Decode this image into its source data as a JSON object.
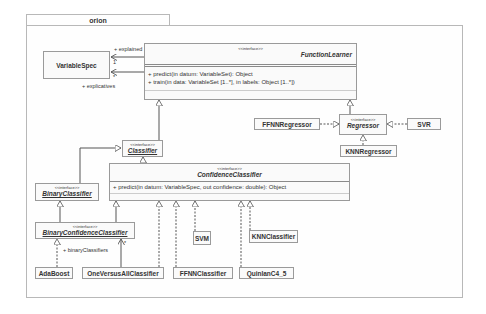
{
  "package": {
    "name": "orion"
  },
  "classes": {
    "variable_spec": {
      "name": "VariableSpec"
    },
    "function_learner": {
      "stereotype": "<<interface>>",
      "name": "FunctionLearner",
      "methods": [
        "+ predict(in datum: VariableSet): Object",
        "+ train(in data: VariableSet [1..*], in labels: Object [1..*])"
      ]
    },
    "regressor": {
      "stereotype": "<<interface>>",
      "name": "Regressor"
    },
    "ffnn_regressor": {
      "name": "FFNNRegressor"
    },
    "svr": {
      "name": "SVR"
    },
    "knn_regressor": {
      "name": "KNNRegressor"
    },
    "classifier": {
      "stereotype": "<<interface>>",
      "name": "Classifier"
    },
    "confidence_classifier": {
      "stereotype": "<<interface>>",
      "name": "ConfidenceClassifier",
      "methods": [
        "+ predict(in datum: VariableSpec, out confidence: double): Object"
      ]
    },
    "binary_classifier": {
      "stereotype": "<<interface>>",
      "name": "BinaryClassifier"
    },
    "binary_confidence_classifier": {
      "stereotype": "<<interface>>",
      "name": "BinaryConfidenceClassifier"
    },
    "ada_boost": {
      "name": "AdaBoost"
    },
    "one_versus_all": {
      "name": "OneVersusAllClassifier"
    },
    "svm": {
      "name": "SVM"
    },
    "knn_classifier": {
      "name": "KNNClassifier"
    },
    "ffnn_classifier": {
      "name": "FFNNClassifier"
    },
    "quinlan": {
      "name": "QuinlanC4_5"
    }
  },
  "associations": {
    "explained": {
      "role": "+ explained",
      "multiplicity": "1"
    },
    "explicatives": {
      "role": "+ explicatives",
      "multiplicity": "*"
    },
    "binary_classifiers": {
      "role": "+ binaryClassifiers",
      "multiplicity": "*"
    }
  },
  "colors": {
    "line": "#555555",
    "border": "#9a9a9a",
    "frame": "#b8b8b8"
  }
}
